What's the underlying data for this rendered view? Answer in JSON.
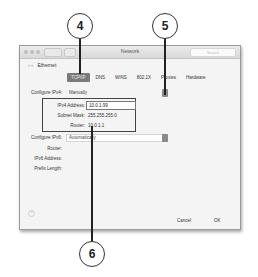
{
  "callouts": [
    {
      "number": "4"
    },
    {
      "number": "5"
    },
    {
      "number": "6"
    }
  ],
  "window": {
    "title": "Network",
    "search_placeholder": "Search",
    "back_label": "Ethernet",
    "tabs": [
      {
        "label": "TCP/IP",
        "active": true
      },
      {
        "label": "DNS"
      },
      {
        "label": "WINS"
      },
      {
        "label": "802.1X"
      },
      {
        "label": "Proxies"
      },
      {
        "label": "Hardware"
      }
    ],
    "ipv4": {
      "configure_label": "Configure IPv4:",
      "configure_value": "Manually",
      "address_label": "IPv4 Address:",
      "address_value": "10.0.1.99",
      "subnet_label": "Subnet Mask:",
      "subnet_value": "255.255.255.0",
      "router_label": "Router:",
      "router_value": "10.0.1.1"
    },
    "ipv6": {
      "configure_label": "Configure IPv6:",
      "configure_value": "Automatically",
      "router_label": "Router:",
      "address_label": "IPv6 Address:",
      "prefix_label": "Prefix Length:"
    },
    "help_label": "?",
    "cancel_label": "Cancel",
    "ok_label": "OK"
  }
}
